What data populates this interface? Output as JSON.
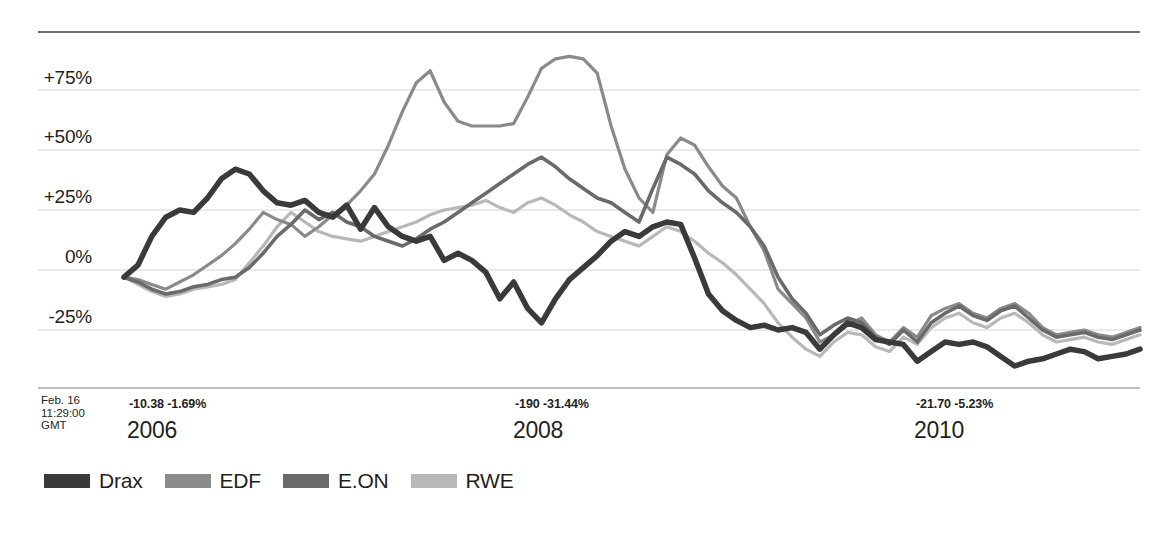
{
  "chart_data": {
    "type": "line",
    "title": "",
    "subtitle": "",
    "xlabel": "",
    "ylabel": "",
    "grid": true,
    "legend_position": "bottom-left",
    "ylim": [
      -50,
      100
    ],
    "ytick_labels": [
      "+75%",
      "+50%",
      "+25%",
      "0%",
      "-25%"
    ],
    "ytick_values": [
      75,
      50,
      25,
      0,
      -25
    ],
    "xtick_labels": [
      "2006",
      "2008",
      "2010"
    ],
    "x_start_label": "2005",
    "x_end_label": "2011",
    "annotations": [
      {
        "id": "timestamp",
        "text": "Feb. 16\n11:29:00\nGMT"
      },
      {
        "id": "delta-2006",
        "change": "-10.38",
        "percent": "-1.69%"
      },
      {
        "id": "delta-2008",
        "change": "-190",
        "percent": "-31.44%"
      },
      {
        "id": "delta-2010",
        "change": "-21.70",
        "percent": "-5.23%"
      }
    ],
    "series": [
      {
        "name": "Drax",
        "color": "#3a3a3a",
        "width": 5.5,
        "values": [
          -3,
          2,
          14,
          22,
          25,
          24,
          30,
          38,
          42,
          40,
          33,
          28,
          27,
          29,
          24,
          22,
          27,
          17,
          26,
          18,
          14,
          12,
          14,
          4,
          7,
          4,
          -1,
          -12,
          -5,
          -16,
          -22,
          -12,
          -4,
          1,
          6,
          12,
          16,
          14,
          18,
          20,
          19,
          5,
          -10,
          -17,
          -21,
          -24,
          -23,
          -25,
          -24,
          -26,
          -33,
          -27,
          -22,
          -24,
          -29,
          -30,
          -31,
          -38,
          -34,
          -30,
          -31,
          -30,
          -32,
          -36,
          -40,
          -38,
          -37,
          -35,
          -33,
          -34,
          -37,
          -36,
          -35,
          -33
        ]
      },
      {
        "name": "EDF",
        "color": "#8a8a8a",
        "width": 3.2,
        "values": [
          -3,
          -4,
          -6,
          -8,
          -5,
          -2,
          2,
          6,
          11,
          17,
          24,
          21,
          19,
          14,
          18,
          23,
          27,
          33,
          40,
          52,
          66,
          78,
          83,
          70,
          62,
          60,
          60,
          60,
          61,
          72,
          84,
          88,
          89,
          88,
          82,
          60,
          42,
          30,
          24,
          48,
          55,
          52,
          43,
          35,
          30,
          18,
          8,
          -8,
          -14,
          -20,
          -30,
          -27,
          -23,
          -20,
          -27,
          -30,
          -24,
          -28,
          -19,
          -16,
          -14,
          -18,
          -20,
          -16,
          -14,
          -18,
          -24,
          -27,
          -26,
          -25,
          -27,
          -28,
          -26,
          -24
        ]
      },
      {
        "name": "E.ON",
        "color": "#6a6a6a",
        "width": 3.6,
        "values": [
          -3,
          -5,
          -8,
          -10,
          -9,
          -7,
          -6,
          -4,
          -3,
          1,
          7,
          14,
          19,
          25,
          21,
          24,
          20,
          18,
          14,
          12,
          10,
          13,
          17,
          20,
          24,
          28,
          32,
          36,
          40,
          44,
          47,
          43,
          38,
          34,
          30,
          28,
          24,
          20,
          34,
          47,
          44,
          40,
          33,
          28,
          24,
          18,
          10,
          -3,
          -12,
          -18,
          -27,
          -23,
          -20,
          -22,
          -28,
          -31,
          -25,
          -30,
          -22,
          -18,
          -15,
          -19,
          -21,
          -17,
          -15,
          -20,
          -25,
          -28,
          -27,
          -26,
          -28,
          -29,
          -27,
          -25
        ]
      },
      {
        "name": "RWE",
        "color": "#b8b8b8",
        "width": 3.2,
        "values": [
          -3,
          -6,
          -9,
          -11,
          -10,
          -8,
          -7,
          -6,
          -4,
          3,
          10,
          18,
          24,
          20,
          16,
          14,
          13,
          12,
          14,
          16,
          18,
          20,
          23,
          25,
          26,
          27,
          29,
          26,
          24,
          28,
          30,
          27,
          23,
          20,
          16,
          14,
          12,
          10,
          14,
          18,
          16,
          12,
          7,
          3,
          -2,
          -8,
          -14,
          -22,
          -28,
          -33,
          -36,
          -30,
          -26,
          -27,
          -32,
          -34,
          -28,
          -31,
          -24,
          -20,
          -18,
          -22,
          -24,
          -20,
          -18,
          -22,
          -27,
          -30,
          -29,
          -28,
          -30,
          -31,
          -29,
          -27
        ]
      }
    ]
  },
  "legend": {
    "items": [
      {
        "label": "Drax",
        "color": "#3a3a3a"
      },
      {
        "label": "EDF",
        "color": "#8a8a8a"
      },
      {
        "label": "E.ON",
        "color": "#6a6a6a"
      },
      {
        "label": "RWE",
        "color": "#b8b8b8"
      }
    ]
  },
  "axis": {
    "y_labels": [
      "+75%",
      "+50%",
      "+25%",
      "0%",
      "-25%"
    ],
    "years": [
      "2006",
      "2008",
      "2010"
    ],
    "deltas": [
      "-10.38 -1.69%",
      "-190 -31.44%",
      "-21.70 -5.23%"
    ],
    "timestamp_line1": "Feb. 16",
    "timestamp_line2": "11:29:00",
    "timestamp_line3": "GMT"
  }
}
